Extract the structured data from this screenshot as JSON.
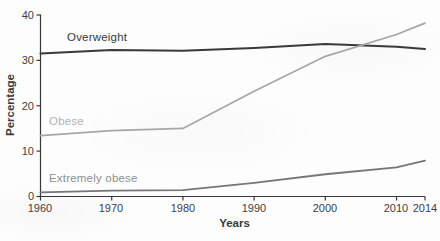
{
  "chart_data": {
    "type": "line",
    "title": "",
    "xlabel": "Years",
    "ylabel": "Percentage",
    "x": [
      1960,
      1970,
      1980,
      1990,
      2000,
      2010,
      2014
    ],
    "series": [
      {
        "name": "Overweight",
        "values": [
          31.5,
          32.3,
          32.1,
          32.7,
          33.6,
          33.0,
          32.5
        ],
        "color": "#3a3a3c",
        "label_color": "#3a3a3c"
      },
      {
        "name": "Obese",
        "values": [
          13.4,
          14.5,
          15.0,
          23.2,
          30.9,
          35.7,
          38.2
        ],
        "color": "#a7a7a9",
        "label_color": "#b2b2b4"
      },
      {
        "name": "Extremely obese",
        "values": [
          0.9,
          1.3,
          1.4,
          3.0,
          4.9,
          6.4,
          7.9
        ],
        "color": "#76767a",
        "label_color": "#8f8f92"
      }
    ],
    "xlim": [
      1960,
      2014
    ],
    "ylim": [
      0,
      40
    ],
    "x_ticks": [
      1960,
      1970,
      1980,
      1990,
      2000,
      2010,
      2014
    ],
    "y_ticks": [
      0,
      10,
      20,
      30,
      40
    ],
    "grid": false,
    "legend": "inline-labels",
    "axis_color": "#39393b",
    "tick_label_color": "#414143"
  }
}
